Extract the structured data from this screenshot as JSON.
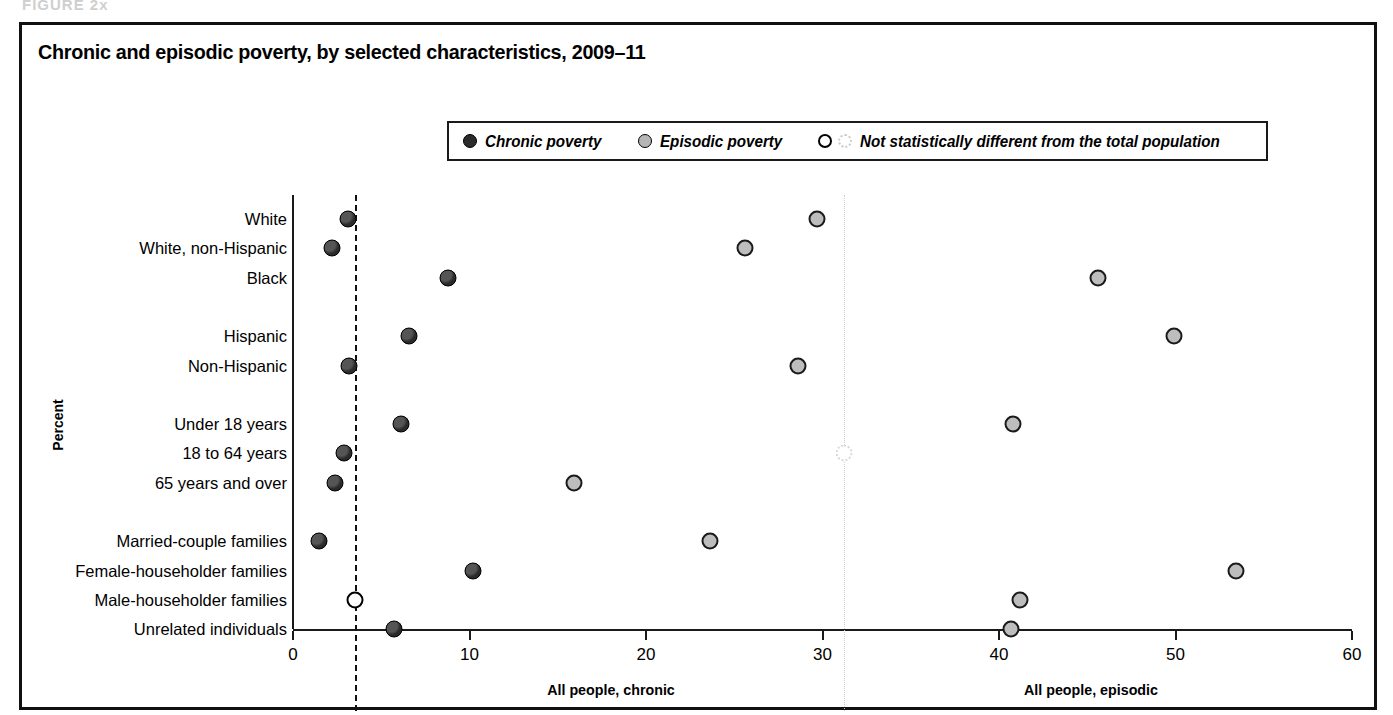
{
  "figure_stub": "FIGURE 2x",
  "title": "Chronic and episodic poverty, by selected characteristics, 2009–11",
  "legend": {
    "items": [
      {
        "label": "Chronic poverty",
        "marker": "filled-dark-circle-icon"
      },
      {
        "label": "Episodic poverty",
        "marker": "filled-gray-circle-icon"
      },
      {
        "label": "Not statistically different from the total population",
        "marker": "open-circle-and-dotted-circle-icon"
      }
    ]
  },
  "axes": {
    "ylabel": "Percent",
    "xticks": [
      "0",
      "10",
      "20",
      "30",
      "40",
      "50",
      "60"
    ],
    "xtick_values": [
      0,
      10,
      20,
      30,
      40,
      50,
      60
    ]
  },
  "reference_lines": [
    {
      "label": "All people, chronic",
      "value": 3.5,
      "style": "dashed"
    },
    {
      "label": "All people, episodic",
      "value": 31.2,
      "style": "dotted"
    }
  ],
  "chart_data": {
    "type": "scatter",
    "title": "Chronic and episodic poverty, by selected characteristics, 2009–11",
    "xlabel": "",
    "ylabel": "Percent",
    "xlim": [
      0,
      60
    ],
    "grid": false,
    "legend_position": "top",
    "categories": [
      "White",
      "White, non-Hispanic",
      "Black",
      "",
      "Hispanic",
      "Non-Hispanic",
      "",
      "Under 18 years",
      "18 to 64 years",
      "65 years and over",
      "",
      "Married-couple families",
      "Female-householder families",
      "Male-householder families",
      "Unrelated individuals"
    ],
    "series": [
      {
        "name": "Chronic poverty",
        "values": [
          3.1,
          2.2,
          8.8,
          null,
          6.6,
          3.2,
          null,
          6.1,
          2.9,
          2.4,
          null,
          1.5,
          10.2,
          3.5,
          5.7
        ],
        "not_significant": [
          false,
          false,
          false,
          null,
          false,
          false,
          null,
          false,
          false,
          false,
          null,
          false,
          false,
          true,
          false
        ]
      },
      {
        "name": "Episodic poverty",
        "values": [
          29.7,
          25.6,
          45.6,
          null,
          49.9,
          28.6,
          null,
          40.8,
          31.2,
          15.9,
          null,
          23.6,
          53.4,
          41.2,
          40.7
        ],
        "not_significant": [
          false,
          false,
          false,
          null,
          false,
          false,
          null,
          false,
          true,
          false,
          null,
          false,
          false,
          false,
          false
        ]
      }
    ]
  }
}
